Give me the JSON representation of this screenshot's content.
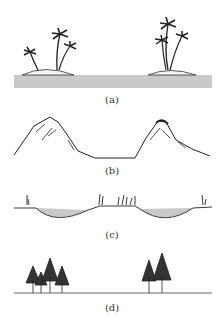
{
  "figure": {
    "panels": [
      {
        "id": "a",
        "caption": "(a)",
        "subject": "islands with palm trees in water"
      },
      {
        "id": "b",
        "caption": "(b)",
        "subject": "two mountain peaks with valley"
      },
      {
        "id": "c",
        "caption": "(c)",
        "subject": "ground profile with water-filled depressions"
      },
      {
        "id": "d",
        "caption": "(d)",
        "subject": "two groups of conifer trees on flat ground"
      }
    ],
    "colors": {
      "water": "#c9c9c9",
      "ink": "#222222",
      "background": "#ffffff"
    }
  }
}
